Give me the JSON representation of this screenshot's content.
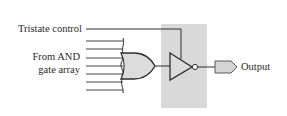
{
  "diagram": {
    "labels": {
      "tristate_control": "Tristate control",
      "from_and_line1": "From AND",
      "from_and_line2": "gate array",
      "output": "Output"
    },
    "components": {
      "or_gate": {
        "type": "OR gate",
        "inputs": 7
      },
      "tristate_buffer": {
        "type": "inverting tristate buffer",
        "shaded_region": true
      },
      "output_pin": {
        "type": "output connector"
      }
    },
    "colors": {
      "line": "#2e2e2e",
      "gate_fill": "#dcdcdc",
      "shade": "#d9d9d9",
      "text": "#2a2a2a"
    }
  }
}
